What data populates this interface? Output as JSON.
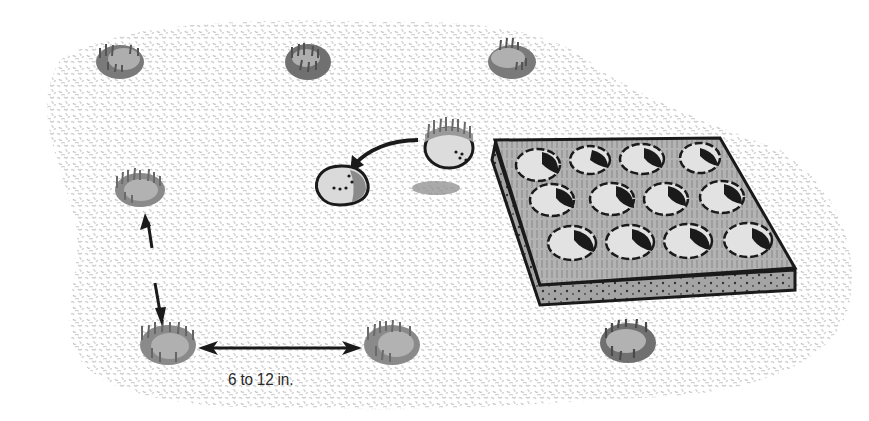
{
  "diagram": {
    "spacing_label": "6 to 12 in.",
    "elements": {
      "planted_plugs": [
        {
          "id": "plug-1",
          "x": 120,
          "y": 62
        },
        {
          "id": "plug-2",
          "x": 308,
          "y": 62
        },
        {
          "id": "plug-3",
          "x": 512,
          "y": 62
        },
        {
          "id": "plug-4",
          "x": 140,
          "y": 190
        },
        {
          "id": "plug-5",
          "x": 168,
          "y": 345
        },
        {
          "id": "plug-6",
          "x": 392,
          "y": 345
        },
        {
          "id": "plug-7",
          "x": 628,
          "y": 343
        }
      ],
      "tray": {
        "rows": 3,
        "cols": 4,
        "cell_count": 12
      },
      "moving_plug": {
        "from": "tray",
        "to": "hole"
      }
    },
    "colors": {
      "ground_speckle": "#c8c8c8",
      "plug_fill": "#a8a8a8",
      "plug_grass": "#6a6a6a",
      "outline": "#1a1a1a",
      "tray_top": "#b4b4b4",
      "tray_side": "#9a9a9a"
    }
  }
}
